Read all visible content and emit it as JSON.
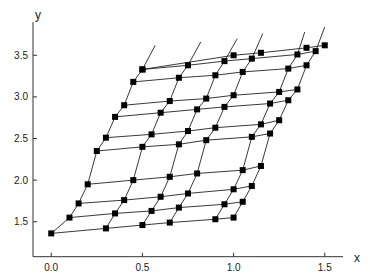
{
  "chart_data": {
    "type": "line",
    "title": "",
    "xlabel": "x",
    "ylabel": "y",
    "xlim": [
      -0.1,
      1.6
    ],
    "ylim": [
      1.08,
      3.9
    ],
    "xticks": [
      0.0,
      0.5,
      1.0,
      1.5
    ],
    "xtick_labels": [
      "0.0",
      "0.5",
      "1.0",
      "1.5"
    ],
    "yticks": [
      1.5,
      2.0,
      2.5,
      3.0,
      3.5
    ],
    "ytick_labels": [
      "1.5",
      "2.0",
      "2.5",
      "3.0",
      "3.5"
    ],
    "grid": false,
    "legend": "none",
    "marker": "square",
    "color": "#000000",
    "rows": [
      {
        "name": "row-1",
        "x": [
          0.0,
          0.3,
          0.5,
          0.65,
          0.9,
          1.0
        ],
        "y": [
          1.36,
          1.42,
          1.46,
          1.49,
          1.53,
          1.55
        ]
      },
      {
        "name": "row-2",
        "x": [
          0.1,
          0.35,
          0.55,
          0.7,
          0.95,
          1.05
        ],
        "y": [
          1.55,
          1.6,
          1.63,
          1.67,
          1.71,
          1.74
        ]
      },
      {
        "name": "row-3",
        "x": [
          0.15,
          0.4,
          0.6,
          0.75,
          1.0,
          1.1
        ],
        "y": [
          1.72,
          1.76,
          1.8,
          1.84,
          1.89,
          1.93
        ]
      },
      {
        "name": "row-4",
        "x": [
          0.2,
          0.45,
          0.65,
          0.8,
          1.05,
          1.15
        ],
        "y": [
          1.95,
          2.0,
          2.04,
          2.08,
          2.12,
          2.17
        ]
      },
      {
        "name": "row-5",
        "x": [
          0.25,
          0.5,
          0.7,
          0.85,
          1.1,
          1.2
        ],
        "y": [
          2.35,
          2.4,
          2.43,
          2.48,
          2.52,
          2.56
        ]
      },
      {
        "name": "row-6",
        "x": [
          0.3,
          0.55,
          0.75,
          0.9,
          1.15,
          1.25
        ],
        "y": [
          2.51,
          2.55,
          2.59,
          2.63,
          2.67,
          2.72
        ]
      },
      {
        "name": "row-7",
        "x": [
          0.35,
          0.6,
          0.8,
          0.95,
          1.2,
          1.3
        ],
        "y": [
          2.76,
          2.81,
          2.85,
          2.88,
          2.92,
          2.96
        ]
      },
      {
        "name": "row-8",
        "x": [
          0.4,
          0.65,
          0.85,
          1.0,
          1.25,
          1.35
        ],
        "y": [
          2.9,
          2.95,
          2.98,
          3.02,
          3.06,
          3.09
        ]
      },
      {
        "name": "row-9",
        "x": [
          0.45,
          0.7,
          0.9,
          1.05,
          1.3,
          1.4
        ],
        "y": [
          3.18,
          3.23,
          3.26,
          3.3,
          3.34,
          3.38
        ]
      },
      {
        "name": "row-10",
        "x": [
          0.5,
          0.75,
          0.95,
          1.1,
          1.35,
          1.45
        ],
        "y": [
          3.33,
          3.38,
          3.43,
          3.46,
          3.51,
          3.55
        ]
      },
      {
        "name": "row-extra",
        "x": [
          0.5,
          1.0,
          1.15,
          1.4,
          1.5
        ],
        "y": [
          3.33,
          3.5,
          3.53,
          3.59,
          3.62
        ]
      }
    ],
    "column_line_tops": [
      {
        "x": 0.57,
        "y": 3.62
      },
      {
        "x": 0.82,
        "y": 3.66
      },
      {
        "x": 1.02,
        "y": 3.7
      },
      {
        "x": 1.16,
        "y": 3.76
      },
      {
        "x": 1.39,
        "y": 3.78
      },
      {
        "x": 1.5,
        "y": 3.84
      }
    ]
  }
}
